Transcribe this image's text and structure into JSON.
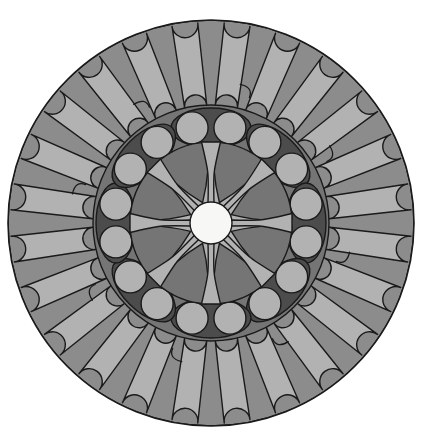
{
  "artwork": {
    "title": "Concentric Rosette Mandala",
    "type": "radial-geometric-illustration",
    "canvas": {
      "width": 425,
      "height": 448,
      "background": "#ffffff"
    },
    "center": {
      "x": 211,
      "y": 223
    },
    "outer_radius": 203,
    "symmetry_order": 8,
    "palette": {
      "background": "#ffffff",
      "light_gray": "#b2b2b2",
      "medium_gray": "#8c8c8c",
      "mid_dark_gray": "#757575",
      "dark_gray": "#4c4c4c",
      "outline": "#1a1a1a",
      "core_white": "#f7f7f5"
    },
    "outline_width": 1.4,
    "rings": [
      {
        "name": "outer-petal-ring",
        "label": "Outer Petal Ring",
        "inner_radius": 118,
        "outer_radius": 203,
        "fill": "#8c8c8c",
        "petal_count": 24,
        "petal_groups": 8,
        "petals_per_group": 3,
        "petal_fill": "#b2b2b2",
        "petal_width": 26,
        "has_hook_marks": true,
        "hook_count": 8
      },
      {
        "name": "mid-annulus-ring",
        "label": "Middle Dark Annulus",
        "inner_radius": 72,
        "outer_radius": 118,
        "fill": "#757575",
        "lens_count": 8,
        "lens_fill": "#4c4c4c",
        "bead_count": 16,
        "bead_radius": 16,
        "bead_fill": "#b2b2b2"
      },
      {
        "name": "inner-petal-ring",
        "label": "Inner Petal Rosette",
        "inner_radius": 15,
        "outer_radius": 80,
        "fill": "#b2b2b2",
        "petal_count": 8,
        "petal_fill": "#757575",
        "spoke_count": 8,
        "spoke_fill": "#b2b2b2"
      },
      {
        "name": "core-disc",
        "label": "Central White Disc",
        "radius": 21,
        "fill": "#f7f7f5"
      }
    ],
    "angles": {
      "inner_petal_start_deg": 0,
      "group_step_deg": 45,
      "petal_step_deg": 15,
      "bead_step_deg": 22.5
    }
  }
}
